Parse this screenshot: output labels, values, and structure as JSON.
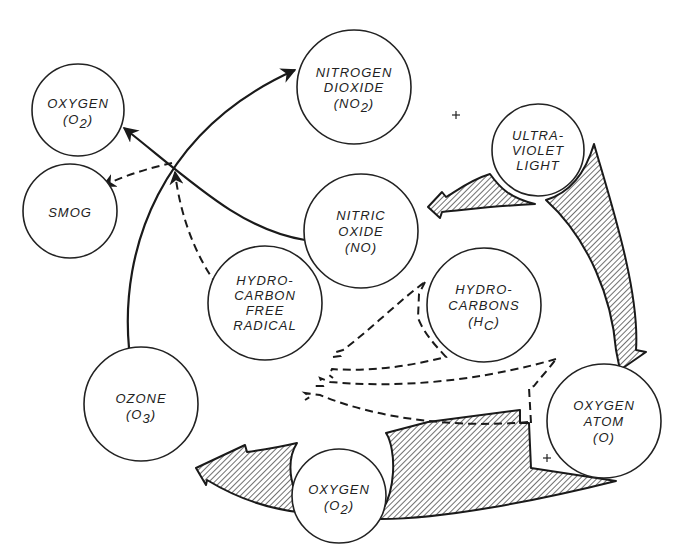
{
  "diagram": {
    "nodes": {
      "oxygen_top": {
        "line1": "OXYGEN",
        "line2_prefix": "(O",
        "line2_sub": "2",
        "line2_suffix": ")"
      },
      "smog": {
        "line1": "SMOG"
      },
      "nitrogen_dioxide": {
        "line1": "NITROGEN",
        "line2": "DIOXIDE",
        "line3_prefix": "(NO",
        "line3_sub": "2",
        "line3_suffix": ")"
      },
      "nitric_oxide": {
        "line1": "NITRIC",
        "line2": "OXIDE",
        "line3": "(NO)"
      },
      "ultraviolet_light": {
        "line1": "ULTRA-",
        "line2": "VIOLET",
        "line3": "LIGHT"
      },
      "hydrocarbon_free_radical": {
        "line1": "HYDRO-",
        "line2": "CARBON",
        "line3": "FREE",
        "line4": "RADICAL"
      },
      "hydrocarbons": {
        "line1": "HYDRO-",
        "line2": "CARBONS",
        "line3_prefix": "(H",
        "line3_sub": "C",
        "line3_suffix": ")"
      },
      "ozone": {
        "line1": "OZONE",
        "line2_prefix": "(O",
        "line2_sub": "3",
        "line2_suffix": ")"
      },
      "oxygen_atom": {
        "line1": "OXYGEN",
        "line2": "ATOM",
        "line3": "(O)"
      },
      "oxygen_bottom": {
        "line1": "OXYGEN",
        "line2_prefix": "(O",
        "line2_sub": "2",
        "line2_suffix": ")"
      }
    },
    "plus_signs": [
      "+",
      "+"
    ],
    "edges": [
      {
        "from": "ozone",
        "to": "nitrogen_dioxide",
        "style": "solid"
      },
      {
        "from": "nitric_oxide",
        "to": "oxygen_top",
        "style": "solid"
      },
      {
        "from": "crossing",
        "to": "smog",
        "style": "dashed"
      },
      {
        "from": "hydrocarbon_free_radical",
        "to": "crossing",
        "style": "dashed"
      },
      {
        "from": "hydrocarbons",
        "to": "hydrocarbon_free_radical",
        "style": "dashed"
      },
      {
        "from": "oxygen_atom",
        "to": "hydrocarbon_free_radical",
        "style": "dashed"
      },
      {
        "from": "ultraviolet_light",
        "to": "nitric_oxide",
        "style": "hatched"
      },
      {
        "from": "ultraviolet_light",
        "to": "oxygen_atom",
        "style": "hatched"
      },
      {
        "from": "oxygen_atom",
        "to": "ozone",
        "style": "hatched"
      }
    ]
  }
}
